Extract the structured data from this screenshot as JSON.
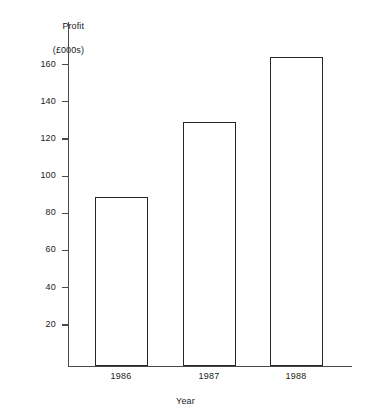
{
  "chart_data": {
    "type": "bar",
    "title": "",
    "categories": [
      "1986",
      "1987",
      "1988"
    ],
    "values": [
      91,
      131,
      166
    ],
    "series": [
      {
        "name": "Profit",
        "values": [
          91,
          131,
          166
        ]
      }
    ],
    "xlabel": "Year",
    "ylabel": "Profit (£000s)",
    "ylabel_line1": "Profit",
    "ylabel_line2": "(£000s)",
    "ylim": [
      0,
      175
    ],
    "yticks": [
      20,
      40,
      60,
      80,
      100,
      120,
      140,
      160
    ],
    "ytick_labels": [
      "20",
      "40",
      "60",
      "80",
      "100",
      "120",
      "140",
      "160"
    ],
    "grid": false,
    "legend": false,
    "bar_fill_color": "#ffffff",
    "bar_edge_color": "#262626",
    "axis_color": "#4a4a4a",
    "background_color": "#ffffff"
  }
}
